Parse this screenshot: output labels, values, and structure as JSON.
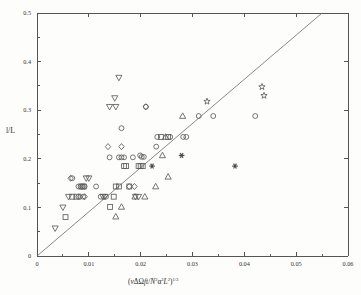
{
  "figure": {
    "background_color": "#fdfdfc",
    "axis_color": "#555555",
    "marker_color": "#5d5d5d",
    "line_color": "#6a6a6a"
  },
  "axes": {
    "y_label": "l/L",
    "x_label_plain": "(vΔΩft/N²α³L²)^1/3",
    "x_label_parts": {
      "open": "(",
      "nu": "v",
      "delta": "Δ",
      "omega": "Ω",
      "ft": "ft/N",
      "n_exp": "2",
      "alpha": "α",
      "alpha_exp": "3",
      "L": "L",
      "L_exp": "2",
      "close": ")",
      "power": "1/3"
    },
    "x_ticks": [
      "0",
      "0.01",
      "0.02",
      "0.03",
      "0.04",
      "0.05",
      "0.06"
    ],
    "x_tick_values": [
      0,
      0.01,
      0.02,
      0.03,
      0.04,
      0.05,
      0.06
    ],
    "y_ticks": [
      "0",
      "0.1",
      "0.2",
      "0.3",
      "0.4",
      "0.5"
    ],
    "y_tick_values": [
      0,
      0.1,
      0.2,
      0.3,
      0.4,
      0.5
    ],
    "x_minor_count": 1,
    "y_minor_count": 1
  },
  "chart_data": {
    "type": "scatter",
    "title": "",
    "xlabel": "(vΔΩft/N²α³L²)^1/3",
    "ylabel": "l/L",
    "xlim": [
      0,
      0.06
    ],
    "ylim": [
      0,
      0.5
    ],
    "grid": false,
    "legend": "none",
    "reference_line": {
      "label": "1:1 reference line through origin",
      "type": "line",
      "slope": 9.1,
      "intercept": 0,
      "x_start": 0,
      "y_start": 0,
      "x_end": 0.055,
      "y_end": 0.5
    },
    "series": [
      {
        "name": "circle",
        "marker": "circle",
        "filled": false,
        "points": [
          [
            0.0068,
            0.16
          ],
          [
            0.008,
            0.143
          ],
          [
            0.0084,
            0.143
          ],
          [
            0.0088,
            0.143
          ],
          [
            0.0092,
            0.143
          ],
          [
            0.008,
            0.122
          ],
          [
            0.0089,
            0.122
          ],
          [
            0.0114,
            0.143
          ],
          [
            0.0123,
            0.122
          ],
          [
            0.0133,
            0.122
          ],
          [
            0.014,
            0.203
          ],
          [
            0.0163,
            0.263
          ],
          [
            0.0158,
            0.203
          ],
          [
            0.0163,
            0.203
          ],
          [
            0.0168,
            0.203
          ],
          [
            0.0185,
            0.203
          ],
          [
            0.0199,
            0.207
          ],
          [
            0.0202,
            0.204
          ],
          [
            0.0206,
            0.204
          ],
          [
            0.023,
            0.225
          ],
          [
            0.0232,
            0.245
          ],
          [
            0.0257,
            0.245
          ],
          [
            0.0282,
            0.245
          ],
          [
            0.0288,
            0.245
          ],
          [
            0.0312,
            0.288
          ],
          [
            0.034,
            0.288
          ],
          [
            0.0421,
            0.288
          ],
          [
            0.021,
            0.307
          ]
        ]
      },
      {
        "name": "square",
        "marker": "square",
        "filled": false,
        "points": [
          [
            0.0055,
            0.08
          ],
          [
            0.0068,
            0.122
          ],
          [
            0.0076,
            0.122
          ],
          [
            0.0086,
            0.143
          ],
          [
            0.009,
            0.143
          ],
          [
            0.0141,
            0.101
          ],
          [
            0.0148,
            0.122
          ],
          [
            0.0152,
            0.143
          ],
          [
            0.0158,
            0.143
          ],
          [
            0.0168,
            0.185
          ],
          [
            0.0172,
            0.185
          ],
          [
            0.0178,
            0.143
          ],
          [
            0.0196,
            0.185
          ],
          [
            0.02,
            0.185
          ],
          [
            0.0204,
            0.185
          ],
          [
            0.0239,
            0.245
          ],
          [
            0.0253,
            0.245
          ]
        ]
      },
      {
        "name": "diamond",
        "marker": "diamond",
        "filled": false,
        "points": [
          [
            0.0065,
            0.16
          ],
          [
            0.0083,
            0.122
          ],
          [
            0.0092,
            0.122
          ],
          [
            0.0137,
            0.225
          ],
          [
            0.0163,
            0.225
          ],
          [
            0.0178,
            0.143
          ],
          [
            0.0188,
            0.143
          ],
          [
            0.021,
            0.307
          ]
        ]
      },
      {
        "name": "triangle-down",
        "marker": "triangle-down",
        "filled": false,
        "points": [
          [
            0.0035,
            0.057
          ],
          [
            0.005,
            0.1
          ],
          [
            0.0061,
            0.122
          ],
          [
            0.0095,
            0.16
          ],
          [
            0.01,
            0.16
          ],
          [
            0.0127,
            0.122
          ],
          [
            0.0131,
            0.122
          ],
          [
            0.014,
            0.307
          ],
          [
            0.015,
            0.325
          ],
          [
            0.0152,
            0.307
          ],
          [
            0.0158,
            0.367
          ],
          [
            0.019,
            0.122
          ],
          [
            0.0196,
            0.122
          ]
        ]
      },
      {
        "name": "triangle-up",
        "marker": "triangle-up",
        "filled": false,
        "points": [
          [
            0.0152,
            0.081
          ],
          [
            0.0163,
            0.101
          ],
          [
            0.0189,
            0.122
          ],
          [
            0.0208,
            0.122
          ],
          [
            0.0229,
            0.143
          ],
          [
            0.0242,
            0.207
          ],
          [
            0.0253,
            0.163
          ],
          [
            0.0248,
            0.245
          ],
          [
            0.0281,
            0.288
          ]
        ]
      },
      {
        "name": "star",
        "marker": "star",
        "filled": false,
        "points": [
          [
            0.0328,
            0.318
          ],
          [
            0.0434,
            0.348
          ],
          [
            0.0438,
            0.33
          ]
        ]
      },
      {
        "name": "asterisk-filled",
        "marker": "asterisk",
        "filled": true,
        "points": [
          [
            0.0222,
            0.185
          ],
          [
            0.0279,
            0.207
          ],
          [
            0.0382,
            0.185
          ]
        ]
      }
    ]
  }
}
